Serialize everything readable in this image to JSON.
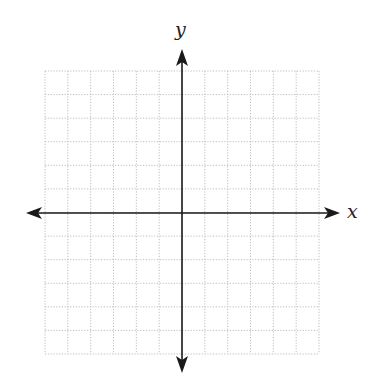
{
  "diagram": {
    "type": "coordinate-plane",
    "x_axis_label": "x",
    "y_axis_label": "y",
    "grid": {
      "columns": 12,
      "rows": 12,
      "left": 45,
      "top": 71,
      "right": 319,
      "bottom": 354,
      "line_style": "dotted",
      "line_color": "#bdbdbd"
    },
    "origin": {
      "x": 182,
      "y": 213
    },
    "axis_color": "#1a1a1a",
    "arrows": [
      "left",
      "right",
      "up",
      "down"
    ]
  }
}
